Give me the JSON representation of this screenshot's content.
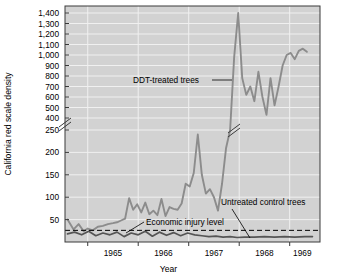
{
  "chart_data": {
    "type": "line",
    "title": "",
    "xlabel": "Year",
    "ylabel": "California red scale density",
    "grid": true,
    "legend_position": "inline-annotations",
    "axis_break": {
      "present": true,
      "between": [
        250,
        400
      ],
      "note": "y-axis broken between 250 and 400"
    },
    "ylim": [
      0,
      1400
    ],
    "y_ticks_lower": [
      50,
      100,
      150,
      200,
      250
    ],
    "y_ticks_upper": [
      400,
      500,
      600,
      700,
      800,
      900,
      1000,
      1100,
      1200,
      1300,
      1400
    ],
    "y_tick_labels_lower": [
      "50",
      "100",
      "150",
      "200",
      "250"
    ],
    "y_tick_labels_upper": [
      "400",
      "500",
      "600",
      "700",
      "800",
      "900",
      "1,000",
      "1,100",
      "1,200",
      "1,300",
      "1,400"
    ],
    "xlim": [
      1964.55,
      1969.6
    ],
    "x_ticks": [
      1965.0,
      1966.0,
      1967.0,
      1968.0,
      1969.0
    ],
    "x_tick_labels": [
      "1965",
      "1966",
      "1967",
      "1968",
      "1969"
    ],
    "x_label_positions": [
      1965.5,
      1966.5,
      1967.5,
      1968.5,
      1969.25
    ],
    "series": [
      {
        "name": "DDT-treated trees",
        "color": "#8c8c8c",
        "x": [
          1964.6,
          1964.72,
          1964.82,
          1964.92,
          1965.0,
          1965.1,
          1965.2,
          1965.3,
          1965.4,
          1965.5,
          1965.58,
          1965.66,
          1965.74,
          1965.82,
          1965.9,
          1965.98,
          1966.06,
          1966.14,
          1966.22,
          1966.3,
          1966.38,
          1966.46,
          1966.54,
          1966.62,
          1966.7,
          1966.78,
          1966.86,
          1966.94,
          1967.02,
          1967.1,
          1967.18,
          1967.26,
          1967.34,
          1967.42,
          1967.5,
          1967.58,
          1967.66,
          1967.74,
          1967.82,
          1967.9,
          1967.98,
          1968.06,
          1968.14,
          1968.22,
          1968.3,
          1968.38,
          1968.46,
          1968.54,
          1968.62,
          1968.7,
          1968.78,
          1968.86,
          1968.94,
          1969.02,
          1969.1,
          1969.18,
          1969.26,
          1969.34
        ],
        "y": [
          50,
          28,
          40,
          24,
          30,
          26,
          34,
          36,
          40,
          42,
          44,
          48,
          52,
          98,
          72,
          84,
          66,
          88,
          62,
          70,
          60,
          96,
          58,
          78,
          74,
          72,
          86,
          130,
          124,
          154,
          240,
          150,
          108,
          118,
          100,
          70,
          130,
          210,
          250,
          980,
          1400,
          780,
          620,
          700,
          560,
          840,
          600,
          430,
          780,
          520,
          700,
          900,
          1000,
          1020,
          960,
          1040,
          1060,
          1030
        ]
      },
      {
        "name": "Untreated control trees",
        "color": "#555555",
        "x": [
          1964.6,
          1964.74,
          1964.88,
          1965.02,
          1965.16,
          1965.3,
          1965.44,
          1965.58,
          1965.72,
          1965.86,
          1966.0,
          1966.14,
          1966.28,
          1966.42,
          1966.56,
          1966.7,
          1966.84,
          1966.98,
          1967.12,
          1967.26,
          1967.4,
          1967.54,
          1967.68,
          1967.82,
          1967.96,
          1968.1,
          1968.3,
          1968.5,
          1968.7,
          1968.9,
          1969.1,
          1969.3,
          1969.45
        ],
        "y": [
          18,
          22,
          16,
          24,
          14,
          20,
          16,
          22,
          12,
          20,
          16,
          24,
          13,
          22,
          15,
          21,
          14,
          20,
          16,
          14,
          12,
          13,
          11,
          12,
          10,
          11,
          11,
          12,
          11,
          12,
          11,
          12,
          12
        ]
      }
    ],
    "reference_lines": [
      {
        "name": "Economic injury level",
        "value": 26,
        "style": "dashed",
        "color": "#000000"
      }
    ],
    "annotations": [
      {
        "name": "ddt-treated-trees",
        "text": "DDT-treated trees"
      },
      {
        "name": "untreated-control-trees",
        "text": "Untreated control trees"
      },
      {
        "name": "economic-injury-level",
        "text": "Economic injury level"
      }
    ],
    "colors": {
      "plot_background": "#d2d2d2",
      "grid": "#f0f0f0",
      "axis": "#3a3a3a",
      "ddt_series": "#8c8c8c",
      "control_series": "#555555",
      "injury_line": "#000000"
    }
  }
}
